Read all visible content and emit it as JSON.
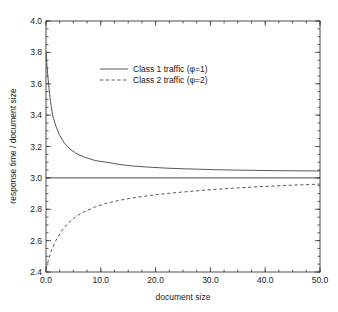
{
  "chart_data": {
    "type": "line",
    "title": "",
    "xlabel": "document size",
    "ylabel": "response time / document size",
    "xlim": [
      0.0,
      50.0
    ],
    "ylim": [
      2.4,
      4.0
    ],
    "xticks": [
      "0.0",
      "10.0",
      "20.0",
      "30.0",
      "40.0",
      "50.0"
    ],
    "xtick_values": [
      0.0,
      10.0,
      20.0,
      30.0,
      40.0,
      50.0
    ],
    "yticks": [
      "2.4",
      "2.6",
      "2.8",
      "3.0",
      "3.2",
      "3.4",
      "3.6",
      "3.8",
      "4.0"
    ],
    "ytick_values": [
      2.4,
      2.6,
      2.8,
      3.0,
      3.2,
      3.4,
      3.6,
      3.8,
      4.0
    ],
    "grid": false,
    "legend_position": "upper center",
    "series": [
      {
        "name": "Class 1 traffic (φ=1)",
        "style": "solid",
        "x": [
          0.0,
          0.3,
          0.7,
          1.2,
          1.8,
          2.5,
          3.4,
          4.5,
          5.8,
          7.2,
          9.0,
          11.0,
          13.5,
          16.0,
          19.0,
          22.0,
          25.0,
          28.0,
          31.0,
          34.0,
          38.0,
          42.0,
          46.0,
          50.0
        ],
        "y": [
          3.8,
          3.66,
          3.52,
          3.4,
          3.33,
          3.27,
          3.22,
          3.18,
          3.15,
          3.13,
          3.11,
          3.1,
          3.085,
          3.075,
          3.068,
          3.062,
          3.058,
          3.055,
          3.052,
          3.05,
          3.048,
          3.046,
          3.045,
          3.044
        ]
      },
      {
        "name": "Class 2 traffic (φ=2)",
        "style": "dashed",
        "x": [
          0.0,
          0.4,
          1.0,
          1.8,
          2.8,
          4.0,
          5.5,
          7.0,
          9.0,
          11.0,
          13.5,
          16.0,
          19.0,
          22.0,
          25.0,
          28.0,
          31.0,
          34.0,
          38.0,
          42.0,
          46.0,
          50.0
        ],
        "y": [
          2.42,
          2.47,
          2.54,
          2.6,
          2.66,
          2.71,
          2.755,
          2.785,
          2.815,
          2.838,
          2.858,
          2.873,
          2.888,
          2.9,
          2.91,
          2.919,
          2.927,
          2.934,
          2.942,
          2.949,
          2.955,
          2.96
        ]
      },
      {
        "name": "baseline",
        "style": "solid-horizontal",
        "x": [
          0.0,
          50.0
        ],
        "y": [
          3.0,
          3.0
        ]
      }
    ],
    "legend": [
      {
        "label": "Class 1 traffic (φ=1)",
        "style": "solid"
      },
      {
        "label": "Class 2 traffic (φ=2)",
        "style": "dashed"
      }
    ],
    "colors": {
      "line": "#3a3a3a",
      "axis": "#3a3a3a",
      "background": "#ffffff",
      "text": "#1a1a1a"
    }
  }
}
